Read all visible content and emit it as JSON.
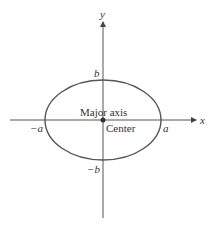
{
  "diagram": {
    "axes": {
      "x_label": "x",
      "y_label": "y"
    },
    "labels": {
      "b": "b",
      "neg_b": "−b",
      "a": "a",
      "neg_a": "−a",
      "major_axis": "Major axis",
      "center": "Center"
    },
    "colors": {
      "ellipse": "#555555",
      "axis": "#555555",
      "text": "#333333"
    }
  }
}
